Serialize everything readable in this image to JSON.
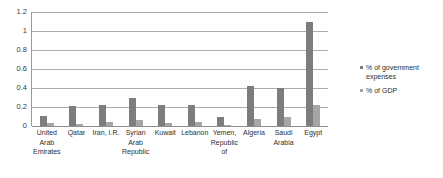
{
  "chart_data": {
    "type": "bar",
    "title": "",
    "subtitle": "",
    "xlabel": "",
    "ylabel": "",
    "ylim": [
      0,
      1.2
    ],
    "yticks": [
      "0",
      "0.2",
      "0.4",
      "0.6",
      "0.8",
      "1",
      "1.2"
    ],
    "ytick_values": [
      0,
      0.2,
      0.4,
      0.6,
      0.8,
      1.0,
      1.2
    ],
    "grid": true,
    "legend_position": "right",
    "categories": [
      "United Arab Emirates",
      "Qatar",
      "Iran, I.R.",
      "Syrian Arab Republic",
      "Kuwait",
      "Lebanon",
      "Yemen, Republic of",
      "Algeria",
      "Saudi Arabia",
      "Egypt"
    ],
    "series": [
      {
        "name": "% of government expenses",
        "color": "#7d7d7d",
        "values": [
          0.11,
          0.21,
          0.22,
          0.29,
          0.22,
          0.22,
          0.09,
          0.42,
          0.4,
          1.1
        ]
      },
      {
        "name": "% of GDP",
        "color": "#a6a6a6",
        "values": [
          0.03,
          0.02,
          0.04,
          0.06,
          0.03,
          0.04,
          0.01,
          0.07,
          0.09,
          0.22
        ]
      }
    ],
    "legend": [
      "% of government expenses",
      "% of GDP"
    ],
    "colors": {
      "series_0": "#7d7d7d",
      "series_1": "#a6a6a6",
      "gridline": "#adadad",
      "axis": "#8d8d8d",
      "text": "#2e2e2e",
      "background": "#ffffff"
    }
  }
}
